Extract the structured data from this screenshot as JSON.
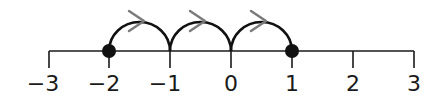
{
  "number_line": {
    "min": -3,
    "max": 3,
    "ticks": [
      {
        "value": -3,
        "label": "−3",
        "x": 49
      },
      {
        "value": -2,
        "label": "−2",
        "x": 109
      },
      {
        "value": -1,
        "label": "−1",
        "x": 170
      },
      {
        "value": 0,
        "label": "0",
        "x": 231
      },
      {
        "value": 1,
        "label": "1",
        "x": 292
      },
      {
        "value": 2,
        "label": "2",
        "x": 353
      },
      {
        "value": 3,
        "label": "3",
        "x": 414
      }
    ],
    "points": [
      {
        "value": -2,
        "filled": true
      },
      {
        "value": 1,
        "filled": true
      }
    ],
    "jumps": [
      {
        "from": -2,
        "to": -1,
        "direction": "right"
      },
      {
        "from": -1,
        "to": 0,
        "direction": "right"
      },
      {
        "from": 0,
        "to": 1,
        "direction": "right"
      }
    ],
    "colors": {
      "line": "#1a1a1a",
      "arrowhead": "#7a7a7a",
      "point": "#111111"
    }
  }
}
